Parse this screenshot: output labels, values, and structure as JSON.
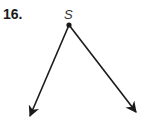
{
  "problem": {
    "number": "16.",
    "vertex_label": "S"
  },
  "figure": {
    "type": "angle",
    "vertex": {
      "label": "S",
      "x": 69,
      "y": 25
    },
    "rays": [
      {
        "name": "left-ray",
        "end_x": 29,
        "end_y": 118
      },
      {
        "name": "right-ray",
        "end_x": 137,
        "end_y": 113
      }
    ],
    "stroke_color": "#1a1a1a"
  }
}
